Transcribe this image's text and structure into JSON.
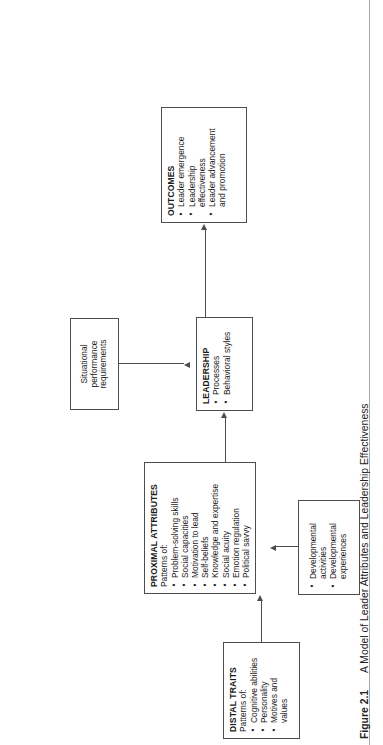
{
  "figure": {
    "number": "Figure 2.1",
    "caption": "A Model of Leader Attributes and Leadership Effectiveness"
  },
  "diagram": {
    "type": "flowchart",
    "boxes": {
      "distal_traits": {
        "title": "DISTAL TRAITS",
        "subtitle": "Patterns of:",
        "items": [
          "Cognitive abilities",
          "Personality",
          "Motives and",
          "values"
        ]
      },
      "proximal_attributes": {
        "title": "PROXIMAL ATTRIBUTES",
        "subtitle": "Patterns of:",
        "items": [
          "Problem-solving skills",
          "Social capacities",
          "Motivation to lead",
          "Self-beliefs",
          "Knowledge and expertise",
          "Social acuity",
          "Emotion regulation",
          "Political savvy"
        ]
      },
      "leadership": {
        "title": "LEADERSHIP",
        "items": [
          "Processes",
          "Behavioral styles"
        ]
      },
      "outcomes": {
        "title": "OUTCOMES",
        "items": [
          "Leader emergence",
          "Leadership",
          "effectiveness",
          "Leader advancement",
          "and promotion"
        ]
      },
      "situational": {
        "line1": "Situational",
        "line2": "performance",
        "line3": "requirements"
      },
      "developmental": {
        "items": [
          "Developmental",
          "activities",
          "Developmental",
          "experiences"
        ]
      }
    },
    "connectors": [
      {
        "name": "distal-to-proximal",
        "from": "distal_traits",
        "to": "proximal_attributes"
      },
      {
        "name": "proximal-to-leadership",
        "from": "proximal_attributes",
        "to": "leadership"
      },
      {
        "name": "leadership-to-outcomes",
        "from": "leadership",
        "to": "outcomes"
      },
      {
        "name": "situational-to-leadership",
        "from": "situational",
        "to": "leadership"
      },
      {
        "name": "developmental-to-proximal",
        "from": "developmental",
        "to": "proximal_attributes"
      }
    ]
  },
  "colors": {
    "stroke": "#4d4d4d",
    "text": "#1a1a1a",
    "page_rule": "#a8a8a8",
    "background": "#ffffff"
  }
}
